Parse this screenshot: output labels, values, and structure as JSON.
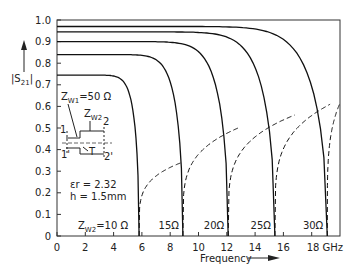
{
  "chart_data": {
    "type": "line",
    "title": "",
    "xlabel": "Frequency",
    "ylabel": "|S21|",
    "xunit": "GHz",
    "xlim": [
      0,
      20
    ],
    "ylim": [
      0,
      1.0
    ],
    "xticks": [
      0,
      2,
      4,
      6,
      8,
      10,
      12,
      14,
      16,
      18
    ],
    "xtick_labels": [
      "0",
      "2",
      "4",
      "6",
      "8",
      "10",
      "12",
      "14",
      "16",
      "18 GHz"
    ],
    "yticks": [
      0,
      0.1,
      0.2,
      0.3,
      0.4,
      0.5,
      0.6,
      0.7,
      0.8,
      0.9,
      1.0
    ],
    "ytick_labels": [
      "0",
      "0.1",
      "0.2",
      "0.3",
      "0.4",
      "0.5",
      "0.6",
      "0.7",
      "0.8",
      "0.9",
      "1.0"
    ],
    "grid": false,
    "legend": "none",
    "annotations": {
      "zw1": "Z",
      "zw1_sub": "W1",
      "zw1_val": "=50 Ω",
      "zw2": "Z",
      "zw2_sub": "W2",
      "port1": "1",
      "port1p": "1'",
      "port2": "2",
      "port2p": "2'",
      "T": "T",
      "er": "εr = 2.32",
      "h": "h = 1.5mm",
      "zw2_label": "Z",
      "zw2_label_sub": "W2",
      "zw2_label_val": "=10 Ω"
    },
    "series": [
      {
        "name": "ZW2 = 10 Ω",
        "label": "ZW2 = 10 Ω",
        "start": 0.745,
        "resonance_ghz": 5.8,
        "dashed_end": 0.34,
        "dashed_end_x": 8.8
      },
      {
        "name": "ZW2 = 15 Ω",
        "label": "15 Ω",
        "start": 0.84,
        "resonance_ghz": 8.9,
        "dashed_end": 0.5,
        "dashed_end_x": 12.8
      },
      {
        "name": "ZW2 = 20 Ω",
        "label": "20 Ω",
        "start": 0.9,
        "resonance_ghz": 12.1,
        "dashed_end": 0.56,
        "dashed_end_x": 16.8
      },
      {
        "name": "ZW2 = 25 Ω",
        "label": "25 Ω",
        "start": 0.945,
        "resonance_ghz": 15.4,
        "dashed_end": 0.61,
        "dashed_end_x": 19.3
      },
      {
        "name": "ZW2 = 30 Ω",
        "label": "30 Ω",
        "start": 0.97,
        "resonance_ghz": 19.1,
        "dashed_end": 0.63,
        "dashed_end_x": 20.1
      }
    ],
    "resonance_labels": [
      "15Ω",
      "20Ω",
      "25Ω",
      "30Ω"
    ]
  }
}
